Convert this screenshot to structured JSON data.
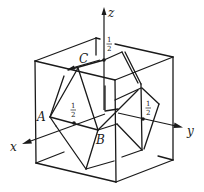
{
  "figure": {
    "axes": {
      "x_label": "x",
      "y_label": "y",
      "z_label": "z"
    },
    "points": {
      "A_label": "A",
      "B_label": "B",
      "C_label": "C"
    },
    "fractions": [
      {
        "numerator": "1",
        "denominator": "2",
        "position": "on z axis near top face"
      },
      {
        "numerator": "1",
        "denominator": "2",
        "position": "on x axis near front face"
      },
      {
        "numerator": "1",
        "denominator": "2",
        "position": "on y axis near right face"
      }
    ],
    "colors": {
      "line": "#1a1a1a",
      "background": "#ffffff"
    }
  }
}
